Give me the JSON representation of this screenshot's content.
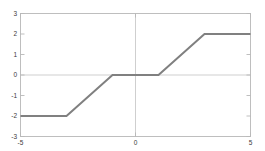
{
  "figure": {
    "background_color": "#ffffff",
    "frame_color": "#b8b8b8",
    "zero_line_color": "#c9c9c9",
    "tick_label_color": "#3a3a3a"
  },
  "chart_data": {
    "type": "line",
    "title": "",
    "subtitle": "",
    "xlabel": "",
    "ylabel": "",
    "xlim": [
      -5,
      5
    ],
    "ylim": [
      -3,
      3
    ],
    "grid": false,
    "legend": null,
    "legend_position": "none",
    "x_ticks": [
      -5,
      0,
      5
    ],
    "x_tick_labels": [
      "-5",
      "0",
      "5"
    ],
    "y_ticks": [
      -3,
      -2,
      -1,
      0,
      1,
      2,
      3
    ],
    "y_tick_labels": [
      "-3",
      "-2",
      "-1",
      "0",
      "1",
      "2",
      "3"
    ],
    "series": [
      {
        "name": "piecewise-saturation",
        "color": "#808080",
        "line_width": 2,
        "x": [
          -5,
          -3,
          -1,
          1,
          3,
          5
        ],
        "values": [
          -2,
          -2,
          0,
          0,
          2,
          2
        ]
      }
    ],
    "annotations": []
  },
  "axis_labels": {
    "x": {
      "left": "-5",
      "middle": "0",
      "right": "5"
    },
    "y": {
      "t3": "3",
      "t2": "2",
      "t1": "1",
      "t0": "0",
      "tm1": "-1",
      "tm2": "-2",
      "tm3": "-3"
    }
  }
}
